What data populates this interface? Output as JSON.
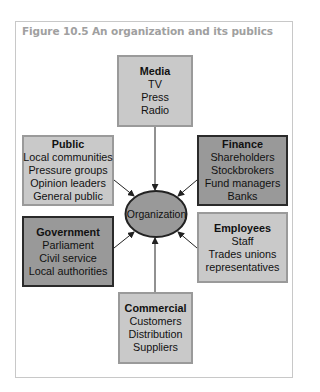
{
  "figure": {
    "title": "Figure 10.5  An organization and its publics",
    "center": {
      "label": "Organization",
      "fill": "#999999"
    },
    "stakeholders": [
      {
        "id": "media",
        "heading": "Media",
        "items": [
          "TV",
          "Press",
          "Radio"
        ],
        "shade": "light"
      },
      {
        "id": "public",
        "heading": "Public",
        "items": [
          "Local communities",
          "Pressure groups",
          "Opinion leaders",
          "General public"
        ],
        "shade": "light"
      },
      {
        "id": "finance",
        "heading": "Finance",
        "items": [
          "Shareholders",
          "Stockbrokers",
          "Fund managers",
          "Banks"
        ],
        "shade": "dark"
      },
      {
        "id": "government",
        "heading": "Government",
        "items": [
          "Parliament",
          "Civil service",
          "Local authorities"
        ],
        "shade": "dark"
      },
      {
        "id": "employees",
        "heading": "Employees",
        "items": [
          "Staff",
          "Trades unions",
          "representatives"
        ],
        "shade": "light"
      },
      {
        "id": "commercial",
        "heading": "Commercial",
        "items": [
          "Customers",
          "Distribution",
          "Suppliers"
        ],
        "shade": "light"
      }
    ],
    "colors": {
      "light_fill": "#c9c9c9",
      "dark_fill": "#999999",
      "title": "#a0a0a0",
      "frame": "#c8c8c8"
    }
  }
}
